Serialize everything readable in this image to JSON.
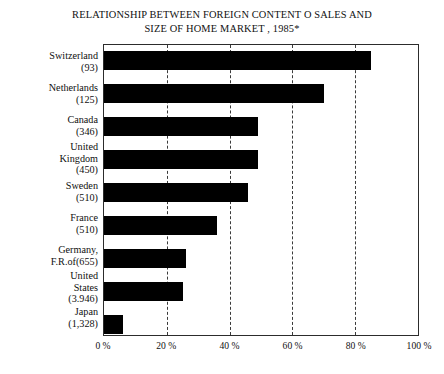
{
  "chart_data": {
    "type": "bar",
    "orientation": "horizontal",
    "title_line1": "RELATIONSHIP BETWEEN FOREIGN CONTENT O SALES AND",
    "title_line2": "SIZE OF HOME MARKET , 1985*",
    "xlabel": "",
    "ylabel": "",
    "xlim": [
      0,
      100
    ],
    "grid": "vertical-dashed",
    "legend": "none",
    "categories": [
      "Switzerland (93)",
      "Netherlands (125)",
      "Canada (346)",
      "United Kingdom (450)",
      "Sweden (510)",
      "France (510)",
      "Germany, F.R.of (655)",
      "United States (3.946)",
      "Japan (1,328)"
    ],
    "values": [
      85,
      70,
      49,
      49,
      46,
      36,
      26,
      25,
      6
    ],
    "bar_color": "#000000",
    "tick_labels": [
      "0 %",
      "20 %",
      "40 %",
      "60 %",
      "80 %",
      "100 %"
    ],
    "tick_values": [
      0,
      20,
      40,
      60,
      80,
      100
    ]
  },
  "categories": [
    {
      "name": "Switzerland",
      "value_label": "(93)",
      "pct": 85
    },
    {
      "name": "Netherlands",
      "value_label": "(125)",
      "pct": 70
    },
    {
      "name": "Canada",
      "value_label": "(346)",
      "pct": 49
    },
    {
      "name": "United Kingdom",
      "value_label": "(450)",
      "pct": 49
    },
    {
      "name": "Sweden",
      "value_label": "(510)",
      "pct": 46
    },
    {
      "name": "France",
      "value_label": "(510)",
      "pct": 36
    },
    {
      "name": "Germany, F.R.of",
      "value_label": "(655)",
      "pct": 26
    },
    {
      "name": "United States",
      "value_label": "(3.946)",
      "pct": 25
    },
    {
      "name": "Japan",
      "value_label": "(1,328)",
      "pct": 6
    }
  ],
  "labels": {
    "switzerland_name": "Switzerland",
    "switzerland_value": "(93)",
    "netherlands_name": "Netherlands",
    "netherlands_value": "(125)",
    "canada_name": "Canada",
    "canada_value": "(346)",
    "uk_name_line1": "United",
    "uk_name_line2": "Kingdom",
    "uk_value": "(450)",
    "sweden_name": "Sweden",
    "sweden_value": "(510)",
    "france_name": "France",
    "france_value": "(510)",
    "germany_name_line1": "Germany,",
    "germany_name_line2": "F.R.of(655)",
    "us_name_line1": "United",
    "us_name_line2": "States",
    "us_value": "(3.946)",
    "japan_name": "Japan",
    "japan_value": "(1,328)"
  },
  "xticks": [
    {
      "label": "0 %",
      "pct": 0
    },
    {
      "label": "20 %",
      "pct": 20
    },
    {
      "label": "40 %",
      "pct": 40
    },
    {
      "label": "60 %",
      "pct": 60
    },
    {
      "label": "80 %",
      "pct": 80
    },
    {
      "label": "100 %",
      "pct": 100
    }
  ]
}
